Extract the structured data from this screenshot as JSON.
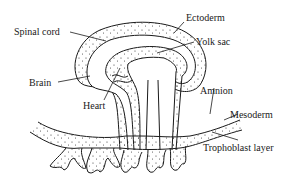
{
  "diagram": {
    "labels": {
      "spinal_cord": "Spinal cord",
      "ectoderm": "Ectoderm",
      "yolk_sac": "Yolk sac",
      "brain": "Brain",
      "heart": "Heart",
      "amnion": "Amnion",
      "mesoderm": "Mesoderm",
      "trophoblast": "Trophoblast layer"
    },
    "colors": {
      "line": "#1a1a1a",
      "background": "#ffffff"
    }
  }
}
